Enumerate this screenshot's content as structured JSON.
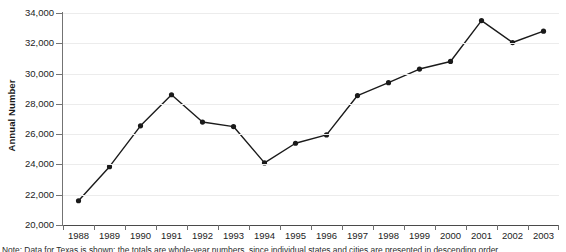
{
  "chart_data": {
    "type": "line",
    "title": "",
    "xlabel": "",
    "ylabel": "Annual Number",
    "categories": [
      "1988",
      "1989",
      "1990",
      "1991",
      "1992",
      "1993",
      "1994",
      "1995",
      "1996",
      "1997",
      "1998",
      "1999",
      "2000",
      "2001",
      "2002",
      "2003"
    ],
    "values": [
      21600,
      23850,
      26550,
      28600,
      26800,
      26500,
      24100,
      25400,
      25950,
      28550,
      29400,
      30300,
      30800,
      33500,
      32050,
      32800
    ],
    "series": [
      {
        "name": "Annual Number",
        "values": [
          21600,
          23850,
          26550,
          28600,
          26800,
          26500,
          24100,
          25400,
          25950,
          28550,
          29400,
          30300,
          30800,
          33500,
          32050,
          32800
        ]
      }
    ],
    "ylim": [
      20000,
      34000
    ],
    "ytick_values": [
      20000,
      22000,
      24000,
      26000,
      28000,
      30000,
      32000,
      34000
    ],
    "ytick_labels": [
      "20,000",
      "22,000",
      "24,000",
      "26,000",
      "28,000",
      "30,000",
      "32,000",
      "34,000"
    ],
    "grid": true,
    "grid_axis": "y",
    "legend": false,
    "legend_position": "none",
    "marker": "circle",
    "line_color": "#1a1a1a",
    "marker_color": "#1a1a1a",
    "gridline_color": "#ececec",
    "axis_color": "#737373",
    "background_color": "#ffffff"
  },
  "footnote": {
    "text": "Note: Data for Texas is shown; the totals are whole-year numbers, since individual states and cities are presented in descending order"
  }
}
